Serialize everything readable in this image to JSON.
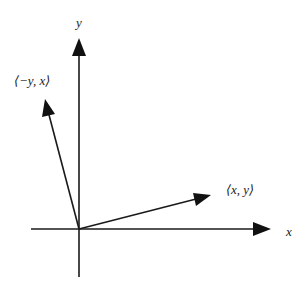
{
  "diagram": {
    "axes": {
      "x_label": "x",
      "y_label": "y"
    },
    "vectors": [
      {
        "id": "v",
        "label": "⟨x, y⟩",
        "components": [
          2,
          0.55
        ]
      },
      {
        "id": "v_perp",
        "label": "⟨−y, x⟩",
        "components": [
          -0.55,
          2
        ]
      }
    ],
    "color": "#1a1a1a"
  }
}
